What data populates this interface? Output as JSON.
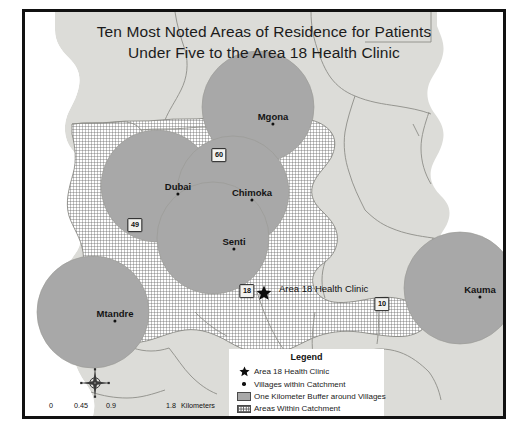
{
  "map": {
    "title_line1": "Ten Most Noted Areas of Residence for Patients",
    "title_line2": "Under Five to the Area 18 Health Clinic",
    "clinic": {
      "name": "Area 18 Health Clinic",
      "marker": "star-marker"
    },
    "villages": [
      {
        "name": "Mgona",
        "x": 248,
        "y": 112
      },
      {
        "name": "Dubai",
        "x": 153,
        "y": 182
      },
      {
        "name": "Chimoka",
        "x": 227,
        "y": 188
      },
      {
        "name": "Senti",
        "x": 209,
        "y": 237
      },
      {
        "name": "Mtandre",
        "x": 90,
        "y": 309
      },
      {
        "name": "Kauma",
        "x": 455,
        "y": 285
      }
    ],
    "road_shields": [
      {
        "label": "60",
        "x": 194,
        "y": 143
      },
      {
        "label": "49",
        "x": 110,
        "y": 213
      },
      {
        "label": "18",
        "x": 222,
        "y": 279
      },
      {
        "label": "10",
        "x": 357,
        "y": 292
      }
    ],
    "colors": {
      "buffer_fill": "#a8a8a8",
      "lilongwe_fill": "#dcdcd8",
      "catchment_fill": "#ffffff",
      "frame": "#111111",
      "boundary_line": "#8d8d88"
    }
  },
  "legend": {
    "title": "Legend",
    "items": [
      {
        "symbol": "star-symbol",
        "label": "Area 18 Health Clinic"
      },
      {
        "symbol": "dot-symbol",
        "label": "Villages within Catchment"
      },
      {
        "symbol": "buffer-swatch",
        "label": "One Kilometer Buffer around Villages"
      },
      {
        "symbol": "catchment-swatch",
        "label": "Areas Within Catchment"
      },
      {
        "symbol": "lilongwe-swatch",
        "label": "Lilongwe, Malawi"
      }
    ]
  },
  "scale_bar": {
    "ticks": [
      "0",
      "0.45",
      "0.9",
      "1.8"
    ],
    "unit": "Kilometers"
  },
  "north_arrow": {
    "name": "north-arrow-compass"
  }
}
